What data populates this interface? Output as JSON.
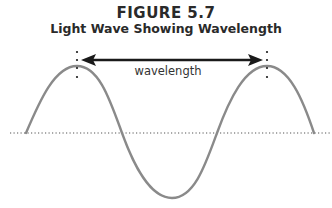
{
  "figure": {
    "number": "FIGURE 5.7",
    "title": "Light Wave Showing Wavelength"
  },
  "diagram": {
    "wave_label": "wavelength",
    "colors": {
      "wave": "#8a8a8a",
      "arrow": "#1a1a1a",
      "baseline": "#555555",
      "text": "#2a2a2a"
    }
  }
}
